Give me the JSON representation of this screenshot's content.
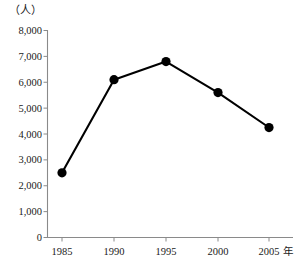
{
  "chart_data": {
    "type": "line",
    "title": "",
    "subtitle": "",
    "xlabel": "年",
    "ylabel": "",
    "unit_label": "（人）",
    "categories": [
      "1985",
      "1990",
      "1995",
      "2000",
      "2005"
    ],
    "x": [
      1985,
      1990,
      1995,
      2000,
      2005
    ],
    "values": [
      2500,
      6100,
      6800,
      5600,
      4250
    ],
    "series": [
      {
        "name": "人数",
        "values": [
          2500,
          6100,
          6800,
          5600,
          4250
        ],
        "color": "#000000",
        "marker": "filled-circle"
      }
    ],
    "ylim": [
      0,
      8000
    ],
    "ytick_step": 1000,
    "ytick_labels": [
      "0",
      "1,000",
      "2,000",
      "3,000",
      "4,000",
      "5,000",
      "6,000",
      "7,000",
      "8,000"
    ],
    "ytick_values": [
      0,
      1000,
      2000,
      3000,
      4000,
      5000,
      6000,
      7000,
      8000
    ],
    "xtick_labels": [
      "1985",
      "1990",
      "1995",
      "2000",
      "2005"
    ],
    "xaxis_suffix": "年",
    "grid": false,
    "legend": false,
    "legend_position": "none",
    "axis_color": "#8a8a8a",
    "line_color": "#000000",
    "background": "#ffffff"
  }
}
